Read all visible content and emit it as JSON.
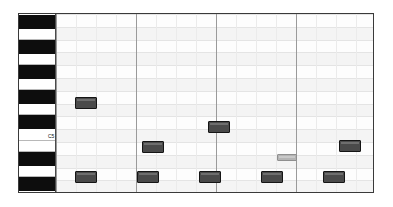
{
  "app": {
    "view_name": "piano-roll-editor",
    "background_color": "#ffffff",
    "frame_color": "#3a3a3a"
  },
  "keyboard": {
    "label_color": "#111111",
    "white_key_color": "#ffffff",
    "black_key_color": "#0d0d0d",
    "keys": [
      {
        "type": "black",
        "top": 1,
        "height": 14,
        "label": ""
      },
      {
        "type": "white",
        "top": 15,
        "height": 11,
        "label": ""
      },
      {
        "type": "black",
        "top": 26,
        "height": 14,
        "label": ""
      },
      {
        "type": "white",
        "top": 40,
        "height": 11,
        "label": ""
      },
      {
        "type": "black",
        "top": 51,
        "height": 14,
        "label": ""
      },
      {
        "type": "white",
        "top": 65,
        "height": 11,
        "label": ""
      },
      {
        "type": "black",
        "top": 76,
        "height": 14,
        "label": ""
      },
      {
        "type": "white",
        "top": 90,
        "height": 11,
        "label": ""
      },
      {
        "type": "black",
        "top": 101,
        "height": 14,
        "label": ""
      },
      {
        "type": "white",
        "top": 115,
        "height": 12,
        "label": "C5"
      },
      {
        "type": "white",
        "top": 127,
        "height": 11,
        "label": ""
      },
      {
        "type": "black",
        "top": 138,
        "height": 14,
        "label": ""
      },
      {
        "type": "white",
        "top": 152,
        "height": 11,
        "label": ""
      },
      {
        "type": "black",
        "top": 163,
        "height": 14,
        "label": ""
      },
      {
        "type": "white",
        "top": 177,
        "height": 2,
        "label": ""
      }
    ]
  },
  "grid": {
    "row_band_color": "#f4f4f4",
    "row_line_color": "#e4e4e4",
    "beat_line_color": "#ebebeb",
    "bar_line_color": "#9a9a9a",
    "row_height": 12.8,
    "row_count": 14,
    "beat_lines": [
      20,
      40,
      60,
      100,
      120,
      140,
      180,
      200,
      220,
      260,
      280,
      300
    ],
    "bar_lines": [
      0,
      80,
      160,
      240,
      318
    ]
  },
  "chart_data": {
    "type": "scatter",
    "xlabel": "Time (ticks)",
    "ylabel": "Pitch",
    "xlim": [
      0,
      318
    ],
    "ylim": [
      0,
      180
    ],
    "notes": [
      {
        "id": "note-1",
        "x": 19,
        "y": 83,
        "w": 22,
        "h": 12,
        "velocity": "high"
      },
      {
        "id": "note-2",
        "x": 152,
        "y": 107,
        "w": 22,
        "h": 12,
        "velocity": "high"
      },
      {
        "id": "note-3",
        "x": 86,
        "y": 127,
        "w": 22,
        "h": 12,
        "velocity": "high"
      },
      {
        "id": "note-4",
        "x": 283,
        "y": 126,
        "w": 22,
        "h": 12,
        "velocity": "high"
      },
      {
        "id": "note-5",
        "x": 221,
        "y": 140,
        "w": 20,
        "h": 7,
        "velocity": "low"
      },
      {
        "id": "note-6",
        "x": 19,
        "y": 157,
        "w": 22,
        "h": 12,
        "velocity": "high"
      },
      {
        "id": "note-7",
        "x": 81,
        "y": 157,
        "w": 22,
        "h": 12,
        "velocity": "high"
      },
      {
        "id": "note-8",
        "x": 143,
        "y": 157,
        "w": 22,
        "h": 12,
        "velocity": "high"
      },
      {
        "id": "note-9",
        "x": 205,
        "y": 157,
        "w": 22,
        "h": 12,
        "velocity": "high"
      },
      {
        "id": "note-10",
        "x": 267,
        "y": 157,
        "w": 22,
        "h": 12,
        "velocity": "high"
      }
    ]
  }
}
